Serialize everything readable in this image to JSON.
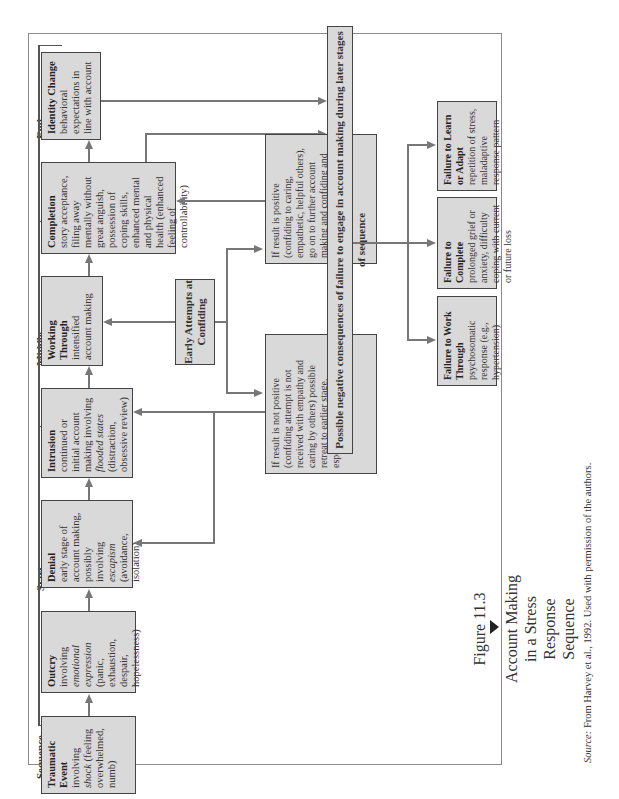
{
  "figure": {
    "number": "Figure 11.3",
    "title_lines": [
      "Account Making",
      "in a Stress",
      "Response",
      "Sequence"
    ],
    "source_label": "Source:",
    "source_text": "From Harvey et al., 1992. Used with permission of the authors."
  },
  "stages": {
    "sequence": "Sequence",
    "start": "Start",
    "middle": "Middle",
    "end": "End"
  },
  "boxes": {
    "traumatic_event": {
      "title": "Traumatic Event",
      "pre": "involving ",
      "em": "shock",
      "post": " (feeling overwhelmed, numb)"
    },
    "outcry": {
      "title": "Outcry",
      "pre": "involving ",
      "em": "emotional expression",
      "post": " (panic, exhaustion, despair, hopelessness)"
    },
    "denial": {
      "title": "Denial",
      "pre": "early stage of account making, possibly involving ",
      "em": "escapism",
      "post": " (avoidance, isolation)"
    },
    "intrusion": {
      "title": "Intrusion",
      "pre": "continued or initial account making involving ",
      "em": "flooded states",
      "post": " (distraction, obsessive review)"
    },
    "working_through": {
      "title": "Working Through",
      "body": "intensified account making"
    },
    "completion": {
      "title": "Completion",
      "body": "story acceptance, filing away mentally without great anguish, possession of coping skills, enhanced mental and physical health (enhanced feeling of controllability)"
    },
    "identity_change": {
      "title": "Identity Change",
      "body": "behavioral expectations in line with account"
    },
    "early_attempts": {
      "title": "Early Attempts at Confiding"
    },
    "positive_result": {
      "body": "If result is positive (confiding to caring, empathetic, helpful others), go on to further account making and confiding and toward completion"
    },
    "negative_result": {
      "body": "If result is not positive (confiding attempt is not received with empathy and caring by others) possible retreat to earlier stage, especially avoidance or denial"
    },
    "negative_consequences": {
      "title": "Possible negative consequences of failure to engage in account making during later stages of sequence"
    },
    "failure_work_through": {
      "title": "Failure to Work Through",
      "body": "psychosomatic response (e.g., hypertension)"
    },
    "failure_complete": {
      "title": "Failure to Complete",
      "body": "prolonged grief or anxiety, difficulty coping with current or future loss"
    },
    "failure_learn": {
      "title": "Failure to Learn or Adapt",
      "body": "repetition of stress, maladaptive response pattern"
    }
  },
  "colors": {
    "box_fill": "#d9d9d9",
    "box_border": "#444444",
    "arrow": "#777777",
    "frame": "#8a8a8a"
  }
}
